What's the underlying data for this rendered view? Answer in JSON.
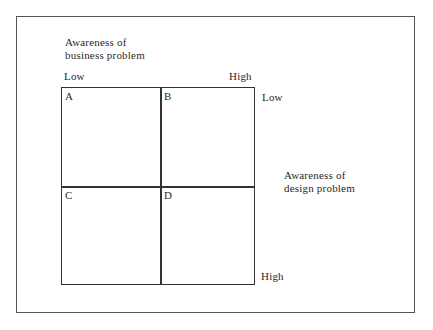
{
  "diagram": {
    "x_axis": {
      "title_line1": "Awareness of",
      "title_line2": "business problem",
      "low_label": "Low",
      "high_label": "High"
    },
    "y_axis": {
      "title_line1": "Awareness of",
      "title_line2": "design problem",
      "low_label": "Low",
      "high_label": "High"
    },
    "quadrants": [
      {
        "label": "A"
      },
      {
        "label": "B"
      },
      {
        "label": "C"
      },
      {
        "label": "D"
      }
    ]
  }
}
